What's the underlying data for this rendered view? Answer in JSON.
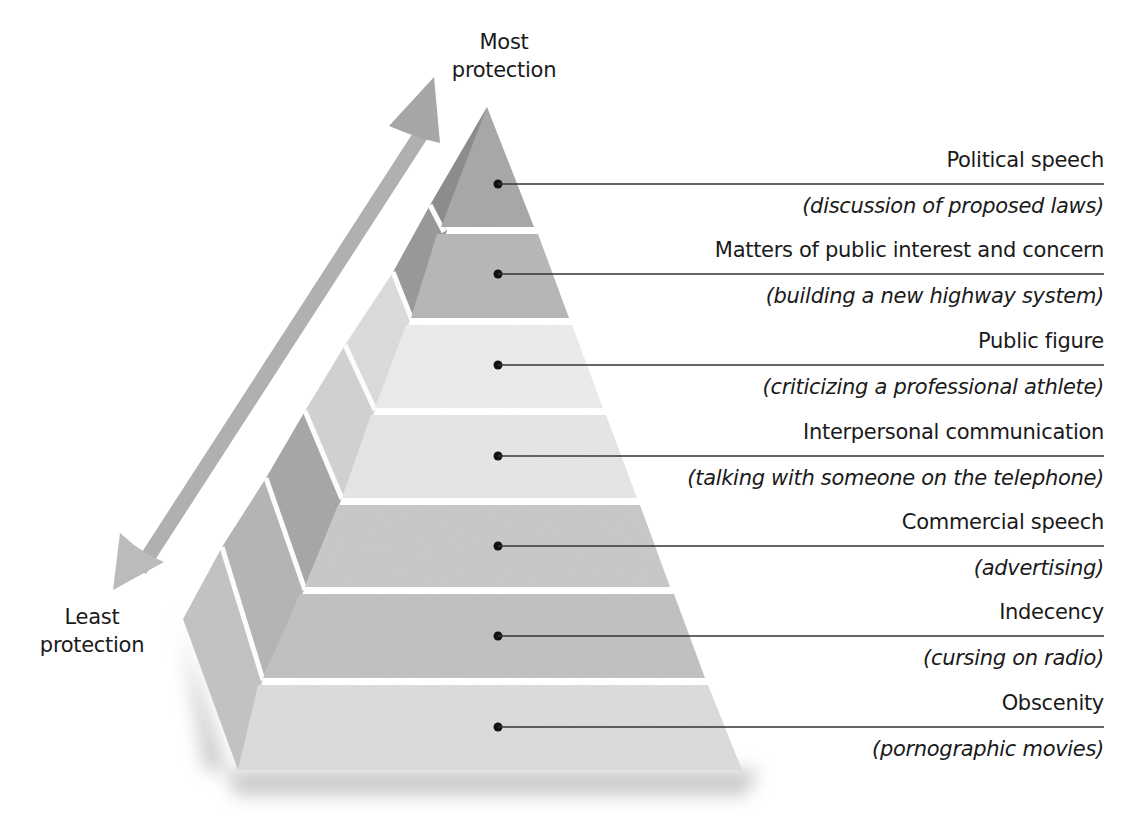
{
  "diagram": {
    "type": "pyramid",
    "top_label": [
      "Most",
      "protection"
    ],
    "bottom_label": [
      "Least",
      "protection"
    ],
    "arrow": "double-headed arrow from least to most protection",
    "tiers": [
      {
        "name": "Political speech",
        "example": "(discussion of proposed laws)",
        "color": "#a9a9a9",
        "side_color": "#8e8e8e"
      },
      {
        "name": "Matters of public interest and concern",
        "example": "(building a new highway system)",
        "color": "#b8b8b8",
        "side_color": "#9a9a9a"
      },
      {
        "name": "Public figure",
        "example": "(criticizing a professional athlete)",
        "color": "#ececec",
        "side_color": "#dcdcdc"
      },
      {
        "name": "Interpersonal communication",
        "example": "(talking with someone on the telephone)",
        "color": "#e6e6e6",
        "side_color": "#cfcfcf"
      },
      {
        "name": "Commercial speech",
        "example": "(advertising)",
        "color": "#c9c9c9",
        "side_color": "#a8a8a8"
      },
      {
        "name": "Indecency",
        "example": "(cursing on radio)",
        "color": "#c2c2c2",
        "side_color": "#b6b6b6"
      },
      {
        "name": "Obscenity",
        "example": "(pornographic movies)",
        "color": "#dcdcdc",
        "side_color": "#c4c4c4"
      }
    ],
    "order": "top = most protection, bottom = least protection"
  }
}
